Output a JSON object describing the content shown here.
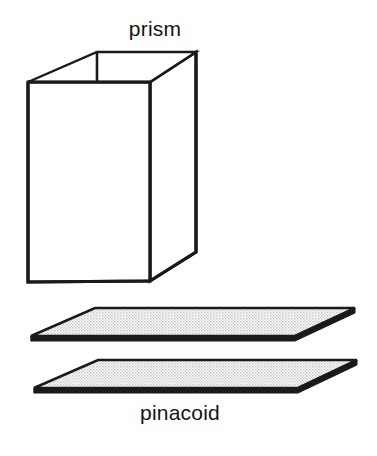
{
  "figure": {
    "title": "",
    "background_color": "#ffffff",
    "stroke_color": "#1a1a1a",
    "plate_fill_color": "#e2e2e2",
    "face_fill_color": "#ffffff",
    "labels": {
      "prism": "prism",
      "pinacoid": "pinacoid"
    },
    "shapes": [
      {
        "name": "prism",
        "kind": "open-top rectangular prism (crystal form)",
        "description": "Four-sided vertical prism drawn in oblique projection with an open top showing interior back walls."
      },
      {
        "name": "pinacoid-upper-plate",
        "kind": "parallelogram plate",
        "description": "Shaded flat horizontal plane representing the upper pinacoid face."
      },
      {
        "name": "pinacoid-lower-plate",
        "kind": "parallelogram plate",
        "description": "Shaded flat horizontal plane representing the lower pinacoid face."
      }
    ]
  },
  "geometry": {
    "prism": {
      "front_face": "28,82 150,82 150,281 28,282",
      "right_face": "150,82 196,52 196,252 150,281",
      "top_rim_outer": "28,82 97,52 196,52 150,82",
      "interior_back_vertical": "97,52 97,82",
      "rear_top_edge": "97,52 196,52"
    },
    "plate_upper": {
      "top_face": "95,308 355,308 295,336 31,336",
      "thickness": 5
    },
    "plate_lower": {
      "top_face": "98,360 357,360 298,388 34,388",
      "thickness": 5
    }
  }
}
